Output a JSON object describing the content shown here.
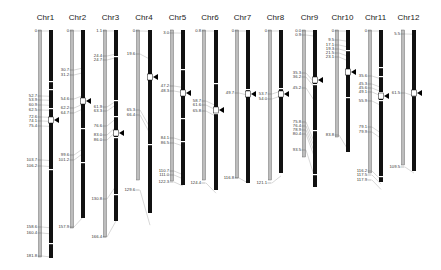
{
  "figure": {
    "type": "comparative-chromosome-map"
  },
  "colors": {
    "map_bar": "#bdbdbd",
    "map_bar_edge": "#555555",
    "physical_bar": "#111111",
    "connector": "#b0b0b0",
    "marker": "#000000"
  },
  "chromosomes": [
    {
      "name": "Chr1",
      "gx": 40,
      "bx": 51,
      "gTop": 30,
      "gBot": 257,
      "bTop": 30,
      "bBot": 258,
      "labels": [
        {
          "t": "0",
          "y": 31
        },
        {
          "t": "52.7",
          "y": 96
        },
        {
          "t": "53.9",
          "y": 100
        },
        {
          "t": "60.9",
          "y": 105
        },
        {
          "t": "62.5",
          "y": 110
        },
        {
          "t": "72.6",
          "y": 117
        },
        {
          "t": "74.1",
          "y": 121
        },
        {
          "t": "75.4",
          "y": 126
        },
        {
          "t": "103.7",
          "y": 160
        },
        {
          "t": "106.2",
          "y": 166
        },
        {
          "t": "158.6",
          "y": 227
        },
        {
          "t": "160.4",
          "y": 233
        },
        {
          "t": "181.8",
          "y": 256
        }
      ],
      "bands": [
        {
          "y": 81
        },
        {
          "y": 89
        },
        {
          "y": 108
        },
        {
          "y": 169
        },
        {
          "y": 243
        }
      ],
      "marker": {
        "y": 120
      }
    },
    {
      "name": "Chr2",
      "gx": 72,
      "bx": 83,
      "gTop": 30,
      "gBot": 228,
      "bTop": 30,
      "bBot": 218,
      "labels": [
        {
          "t": "0",
          "y": 31
        },
        {
          "t": "30.7",
          "y": 70
        },
        {
          "t": "31.2",
          "y": 75
        },
        {
          "t": "54.6",
          "y": 99
        },
        {
          "t": "62.2",
          "y": 108
        },
        {
          "t": "64.7",
          "y": 113
        },
        {
          "t": "99.6",
          "y": 155
        },
        {
          "t": "101.2",
          "y": 160
        },
        {
          "t": "157.9",
          "y": 227
        }
      ],
      "bands": [
        {
          "y": 100
        },
        {
          "y": 128
        },
        {
          "y": 162
        }
      ],
      "marker": {
        "y": 101
      }
    },
    {
      "name": "Chr3",
      "gx": 105,
      "bx": 116,
      "gTop": 30,
      "gBot": 237,
      "bTop": 30,
      "bBot": 221,
      "labels": [
        {
          "t": "1.1",
          "y": 31
        },
        {
          "t": "24.4",
          "y": 56
        },
        {
          "t": "24.7",
          "y": 60
        },
        {
          "t": "61.9",
          "y": 107
        },
        {
          "t": "63.3",
          "y": 111
        },
        {
          "t": "76.6",
          "y": 126
        },
        {
          "t": "83.0",
          "y": 135
        },
        {
          "t": "86.0",
          "y": 140
        },
        {
          "t": "130.8",
          "y": 199
        },
        {
          "t": "166.4",
          "y": 237
        }
      ],
      "bands": [
        {
          "y": 56
        },
        {
          "y": 100
        },
        {
          "y": 116
        },
        {
          "y": 137
        },
        {
          "y": 194
        }
      ],
      "marker": {
        "y": 133
      }
    },
    {
      "name": "Chr4",
      "gx": 138,
      "bx": 150,
      "gTop": 30,
      "gBot": 180,
      "bTop": 30,
      "bBot": 213,
      "labels": [
        {
          "t": "0",
          "y": 31
        },
        {
          "t": "19.6",
          "y": 54
        },
        {
          "t": "65.3",
          "y": 110
        },
        {
          "t": "66.4",
          "y": 115
        },
        {
          "t": "129.6",
          "y": 190
        }
      ],
      "bands": [
        {
          "y": 74
        },
        {
          "y": 78
        },
        {
          "y": 144
        }
      ],
      "marker": {
        "y": 77
      }
    },
    {
      "name": "Chr5",
      "gx": 172,
      "bx": 183,
      "gTop": 30,
      "gBot": 181,
      "bTop": 30,
      "bBot": 185,
      "labels": [
        {
          "t": "3.0",
          "y": 33
        },
        {
          "t": "47.2",
          "y": 86
        },
        {
          "t": "48.3",
          "y": 91
        },
        {
          "t": "84.1",
          "y": 138
        },
        {
          "t": "86.5",
          "y": 143
        },
        {
          "t": "110.7",
          "y": 171
        },
        {
          "t": "111.0",
          "y": 175
        },
        {
          "t": "122.3",
          "y": 182
        }
      ],
      "bands": [
        {
          "y": 69
        },
        {
          "y": 118
        },
        {
          "y": 141
        }
      ],
      "marker": {
        "y": 93
      }
    },
    {
      "name": "Chr6",
      "gx": 204,
      "bx": 216,
      "gTop": 30,
      "gBot": 180,
      "bTop": 30,
      "bBot": 190,
      "labels": [
        {
          "t": "0.8",
          "y": 31
        },
        {
          "t": "58.7",
          "y": 101
        },
        {
          "t": "61.6",
          "y": 105
        },
        {
          "t": "65.8",
          "y": 111
        },
        {
          "t": "124.4",
          "y": 183
        }
      ],
      "bands": [
        {
          "y": 83
        },
        {
          "y": 107
        },
        {
          "y": 113
        }
      ],
      "marker": {
        "y": 110
      }
    },
    {
      "name": "Chr7",
      "gx": 237,
      "bx": 248,
      "gTop": 30,
      "gBot": 178,
      "bTop": 30,
      "bBot": 183,
      "labels": [
        {
          "t": "0",
          "y": 31
        },
        {
          "t": "49.7",
          "y": 93
        },
        {
          "t": "116.8",
          "y": 178
        }
      ],
      "bands": [
        {
          "y": 89
        },
        {
          "y": 94
        }
      ],
      "marker": {
        "y": 94
      }
    },
    {
      "name": "Chr8",
      "gx": 270,
      "bx": 281,
      "gTop": 30,
      "gBot": 180,
      "bTop": 30,
      "bBot": 173,
      "labels": [
        {
          "t": "0",
          "y": 31
        },
        {
          "t": "53.7",
          "y": 94
        },
        {
          "t": "54.0",
          "y": 99
        },
        {
          "t": "121.1",
          "y": 183
        }
      ],
      "bands": [
        {
          "y": 88
        }
      ],
      "marker": {
        "y": 94
      }
    },
    {
      "name": "Chr9",
      "gx": 304,
      "bx": 315,
      "gTop": 30,
      "gBot": 157,
      "bTop": 30,
      "bBot": 187,
      "labels": [
        {
          "t": "0.0",
          "y": 31
        },
        {
          "t": "0.9",
          "y": 35
        },
        {
          "t": "35.3",
          "y": 73
        },
        {
          "t": "36.2",
          "y": 77
        },
        {
          "t": "45.2",
          "y": 88
        },
        {
          "t": "75.8",
          "y": 122
        },
        {
          "t": "76.4",
          "y": 126
        },
        {
          "t": "78.9",
          "y": 130
        },
        {
          "t": "80.4",
          "y": 134
        },
        {
          "t": "93.5",
          "y": 150
        }
      ],
      "bands": [
        {
          "y": 84
        },
        {
          "y": 130
        },
        {
          "y": 174
        }
      ],
      "marker": {
        "y": 80
      }
    },
    {
      "name": "Chr10",
      "gx": 337,
      "bx": 348,
      "gTop": 30,
      "gBot": 137,
      "bTop": 30,
      "bBot": 152,
      "labels": [
        {
          "t": "0",
          "y": 31
        },
        {
          "t": "9.5",
          "y": 40
        },
        {
          "t": "17.1",
          "y": 45
        },
        {
          "t": "19.3",
          "y": 49
        },
        {
          "t": "21.5",
          "y": 53
        },
        {
          "t": "23.1",
          "y": 57
        },
        {
          "t": "83.8",
          "y": 135
        }
      ],
      "bands": [
        {
          "y": 50
        },
        {
          "y": 70
        },
        {
          "y": 97
        }
      ],
      "marker": {
        "y": 72
      }
    },
    {
      "name": "Chr11",
      "gx": 370,
      "bx": 381,
      "gTop": 30,
      "gBot": 173,
      "bTop": 30,
      "bBot": 182,
      "labels": [
        {
          "t": "0",
          "y": 31
        },
        {
          "t": "35.6",
          "y": 76
        },
        {
          "t": "45.3",
          "y": 84
        },
        {
          "t": "45.6",
          "y": 88
        },
        {
          "t": "49.1",
          "y": 92
        },
        {
          "t": "55.9",
          "y": 101
        },
        {
          "t": "79.1",
          "y": 127
        },
        {
          "t": "79.9",
          "y": 132
        },
        {
          "t": "116.2",
          "y": 171
        },
        {
          "t": "117.5",
          "y": 175
        },
        {
          "t": "117.9",
          "y": 180
        }
      ],
      "bands": [
        {
          "y": 67
        },
        {
          "y": 76
        },
        {
          "y": 92
        },
        {
          "y": 100
        },
        {
          "y": 176
        }
      ],
      "marker": {
        "y": 96
      }
    },
    {
      "name": "Chr12",
      "gx": 403,
      "bx": 414,
      "gTop": 30,
      "gBot": 165,
      "bTop": 30,
      "bBot": 171,
      "labels": [
        {
          "t": "5.5",
          "y": 34
        },
        {
          "t": "61.5",
          "y": 93
        },
        {
          "t": "109.5",
          "y": 167
        }
      ],
      "bands": [
        {
          "y": 91
        },
        {
          "y": 95
        }
      ],
      "marker": {
        "y": 93
      }
    }
  ]
}
